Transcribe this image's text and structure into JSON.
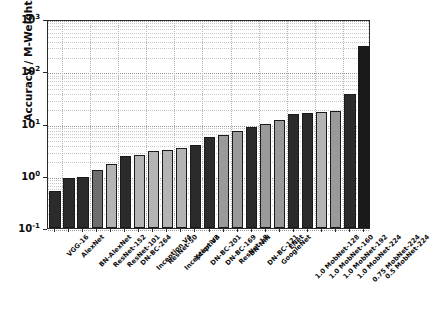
{
  "chart_data": {
    "type": "bar",
    "title": "",
    "xlabel": "",
    "ylabel": "Accuracy / M-Weights",
    "yscale": "log",
    "ylim": [
      0.1,
      1000
    ],
    "ytick_labels": [
      "10-1",
      "100",
      "101",
      "102",
      "103"
    ],
    "ytick_values": [
      0.1,
      1,
      10,
      100,
      1000
    ],
    "grid": true,
    "legend": "none",
    "categories": [
      "VGG-16",
      "AlexNet",
      "BN-AlexNet",
      "ResNet-152",
      "ResNet-101",
      "DN-BC-264",
      "Inception V4",
      "ResNet-50",
      "Inception V3",
      "Xception",
      "DN-BC-201",
      "DN-BC-169",
      "ResNet-18",
      "BN-NIN",
      "DN-BC-121",
      "GoogleNet",
      "ENet",
      "1.0 MobNet-128",
      "1.0 MobNet-160",
      "1.0 MobNet-192",
      "1.0 MobNet-224",
      "0.75 MobNet-224",
      "0.5 MobNet-224"
    ],
    "values": [
      0.52,
      0.89,
      0.95,
      1.3,
      1.65,
      2.4,
      2.45,
      2.95,
      3.1,
      3.4,
      3.85,
      5.5,
      5.9,
      7.1,
      8.4,
      10.0,
      11.8,
      15.5,
      16.2,
      16.8,
      17.0,
      36.0,
      300.0
    ],
    "bar_shades": [
      "#2b2b2b",
      "#2b2b2b",
      "#2b2b2b",
      "#6e6e6e",
      "#b4b4b4",
      "#2b2b2b",
      "#b4b4b4",
      "#b4b4b4",
      "#b4b4b4",
      "#b4b4b4",
      "#2b2b2b",
      "#2b2b2b",
      "#9a9a9a",
      "#9a9a9a",
      "#2b2b2b",
      "#9a9a9a",
      "#9a9a9a",
      "#2b2b2b",
      "#2b2b2b",
      "#b4b4b4",
      "#9a9a9a",
      "#2b2b2b",
      "#1a1a1a"
    ]
  },
  "colors": {
    "axis": "#2b2b2b",
    "grid": "#9a9a9a",
    "background": "#ffffff",
    "text": "#0d0d0d"
  }
}
